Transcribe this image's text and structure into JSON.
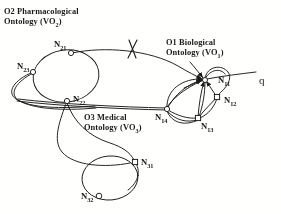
{
  "figure": {
    "background_color": "#fdfdfc",
    "stroke_color": "#1b1b1b",
    "node_fill_color": "#ffffff",
    "width": 281,
    "height": 214
  },
  "ontologies": [
    {
      "id": "O1",
      "title_line1": "O1 Biological",
      "title_line2_prefix": "Ontology (VO",
      "title_sub": "1",
      "title_suffix": ")"
    },
    {
      "id": "O2",
      "title_line1": "O2 Pharmacological",
      "title_line2_prefix": "Ontology (VO",
      "title_sub": "2",
      "title_suffix": ")"
    },
    {
      "id": "O3",
      "title_line1": "O3 Medical",
      "title_line2_prefix": "Ontology (VO",
      "title_sub": "3",
      "title_suffix": ")"
    }
  ],
  "nodes": [
    {
      "name": "N",
      "sub": "11",
      "ontology": "O1",
      "x": 205,
      "y": 80,
      "shape": "circle"
    },
    {
      "name": "N",
      "sub": "12",
      "ontology": "O1",
      "x": 217,
      "y": 97,
      "shape": "square"
    },
    {
      "name": "N",
      "sub": "13",
      "ontology": "O1",
      "x": 198,
      "y": 118,
      "shape": "square"
    },
    {
      "name": "N",
      "sub": "14",
      "ontology": "O1",
      "x": 167,
      "y": 108,
      "shape": "circle"
    },
    {
      "name": "N",
      "sub": "21",
      "ontology": "O2",
      "x": 71,
      "y": 53,
      "shape": "circle"
    },
    {
      "name": "N",
      "sub": "22",
      "ontology": "O2",
      "x": 67,
      "y": 101,
      "shape": "circle"
    },
    {
      "name": "N",
      "sub": "23",
      "ontology": "O2",
      "x": 33,
      "y": 72,
      "shape": "circle"
    },
    {
      "name": "N",
      "sub": "31",
      "ontology": "O3",
      "x": 135,
      "y": 162,
      "shape": "square"
    },
    {
      "name": "N",
      "sub": "32",
      "ontology": "O3",
      "x": 99,
      "y": 196,
      "shape": "circle"
    }
  ],
  "annotations": {
    "query_label": "q",
    "blocked_mark": "x-cross-mark"
  }
}
